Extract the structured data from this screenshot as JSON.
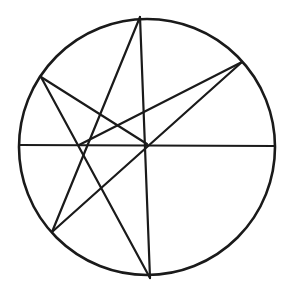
{
  "diagram": {
    "stroke_color": "#1a1a1a",
    "background_color": "#ffffff",
    "circle": {
      "cx": 147,
      "cy": 147,
      "r": 128
    },
    "points": {
      "T": [
        140,
        17
      ],
      "B": [
        150,
        278
      ],
      "UL": [
        41,
        77
      ],
      "UR": [
        242,
        62
      ],
      "LL": [
        52,
        232
      ],
      "L": [
        19,
        145
      ],
      "R": [
        275,
        146
      ],
      "P": [
        79,
        145
      ],
      "C": [
        147,
        144
      ]
    },
    "segments": [
      {
        "name": "horizontal-diameter",
        "from": "L",
        "to": "R"
      },
      {
        "name": "vertical-chord",
        "from": "T",
        "to": "B"
      },
      {
        "name": "chord-T-LL",
        "from": "T",
        "to": "LL"
      },
      {
        "name": "chord-UL-B",
        "from": "UL",
        "to": "B"
      },
      {
        "name": "segment-UL-C",
        "from": "UL",
        "to": "C"
      },
      {
        "name": "segment-P-UR",
        "from": "P",
        "to": "UR"
      },
      {
        "name": "chord-LL-UR",
        "from": "LL",
        "to": "UR"
      }
    ]
  }
}
